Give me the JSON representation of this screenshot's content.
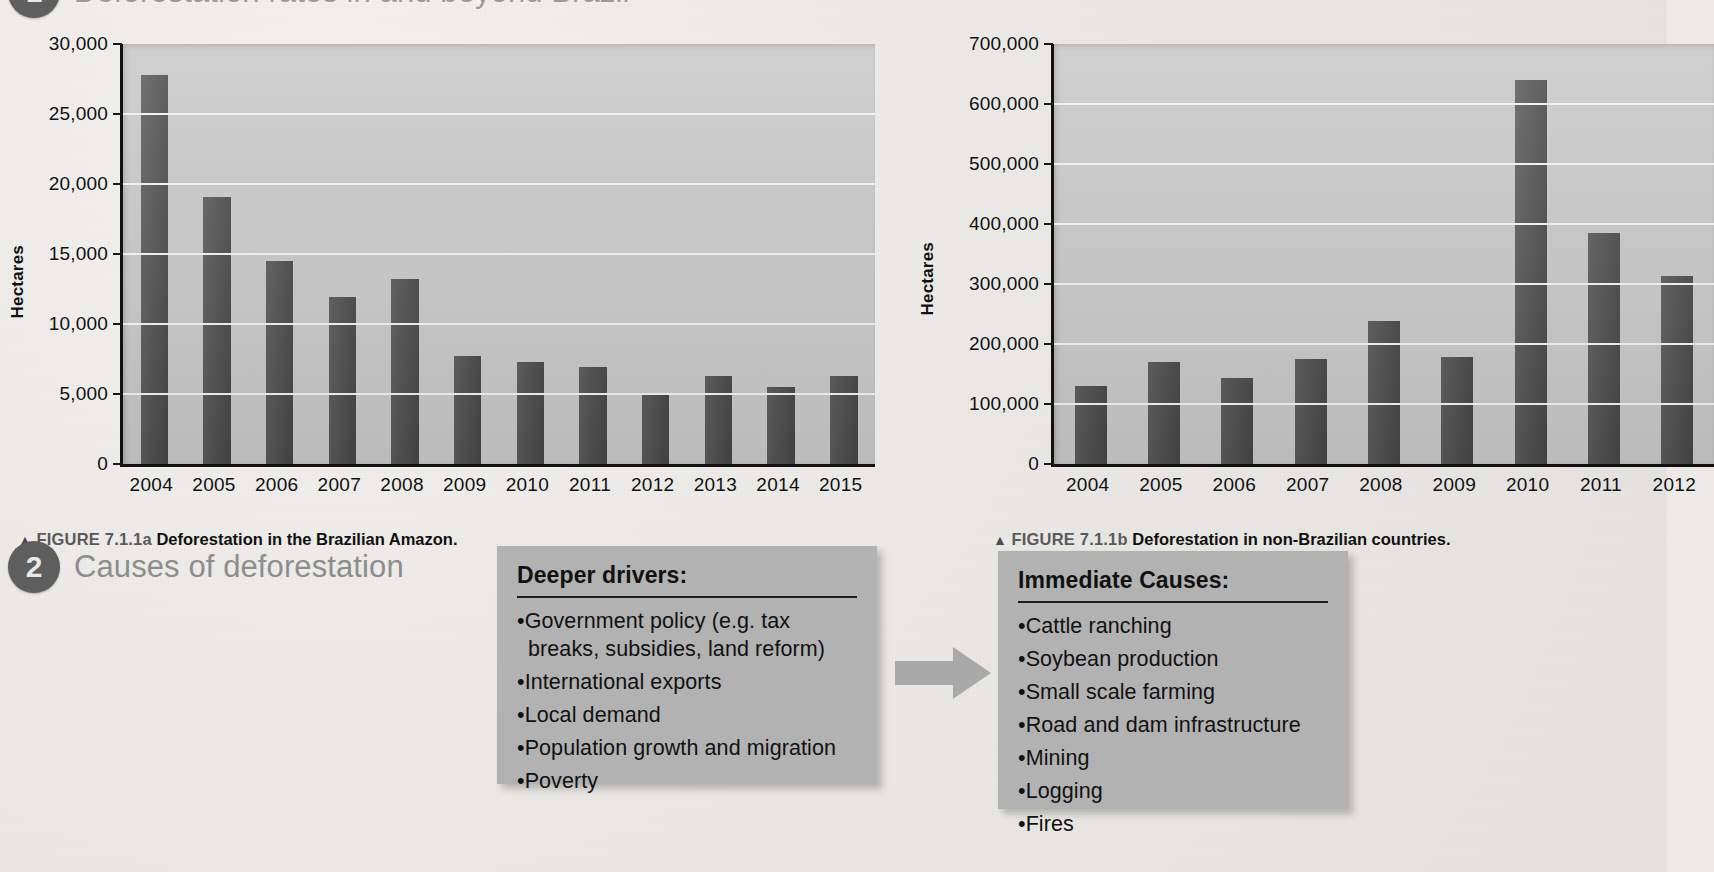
{
  "page": {
    "background_color": "#eceae6",
    "bar_color": "#4c4c4c",
    "plot_color": "#c7c7c7",
    "box_color": "#b2b2b2"
  },
  "sections": [
    {
      "number": "1",
      "title": "Deforestation rates in and beyond Brazil"
    },
    {
      "number": "2",
      "title": "Causes of deforestation"
    }
  ],
  "figure_a": {
    "caption_triangle": "▲",
    "caption_number": "FIGURE 7.1.1a",
    "caption_text": "Deforestation in the Brazilian Amazon."
  },
  "figure_b": {
    "caption_triangle": "▲",
    "caption_number": "FIGURE 7.1.1b",
    "caption_text": "Deforestation in non-Brazilian countries."
  },
  "boxes": {
    "drivers": {
      "title": "Deeper drivers:",
      "items": [
        "•Government policy (e.g. tax breaks, subsidies, land reform)",
        "•International exports",
        "•Local demand",
        "•Population growth and migration",
        "•Poverty"
      ]
    },
    "immediate": {
      "title": "Immediate Causes:",
      "items": [
        "•Cattle ranching",
        "•Soybean production",
        "•Small scale farming",
        "•Road and dam infrastructure",
        "•Mining",
        "•Logging",
        "•Fires"
      ]
    }
  },
  "chart_data": [
    {
      "id": "a",
      "type": "bar",
      "title": "Deforestation in the Brazilian Amazon.",
      "xlabel": "",
      "ylabel": "Hectares",
      "ylim": [
        0,
        30000
      ],
      "ytick_labels": [
        "30,000",
        "25,000",
        "20,000",
        "15,000",
        "10,000",
        "5,000",
        "0"
      ],
      "yticks": [
        30000,
        25000,
        20000,
        15000,
        10000,
        5000,
        0
      ],
      "grid": true,
      "legend": "none",
      "categories": [
        "2004",
        "2005",
        "2006",
        "2007",
        "2008",
        "2009",
        "2010",
        "2011",
        "2012",
        "2013",
        "2014",
        "2015"
      ],
      "values": [
        27800,
        19100,
        14500,
        11900,
        13200,
        7700,
        7300,
        6900,
        5000,
        6300,
        5500,
        6300
      ]
    },
    {
      "id": "b",
      "type": "bar",
      "title": "Deforestation in non-Brazilian countries.",
      "xlabel": "",
      "ylabel": "Hectares",
      "ylim": [
        0,
        700000
      ],
      "ytick_labels": [
        "700,000",
        "600,000",
        "500,000",
        "400,000",
        "300,000",
        "200,000",
        "100,000",
        "0"
      ],
      "yticks": [
        700000,
        600000,
        500000,
        400000,
        300000,
        200000,
        100000,
        0
      ],
      "grid": true,
      "legend": "none",
      "categories": [
        "2004",
        "2005",
        "2006",
        "2007",
        "2008",
        "2009",
        "2010",
        "2011",
        "2012"
      ],
      "values": [
        130000,
        170000,
        143000,
        175000,
        238000,
        178000,
        640000,
        385000,
        313000
      ]
    }
  ]
}
